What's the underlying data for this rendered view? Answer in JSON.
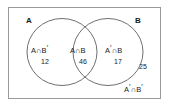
{
  "diagram": {
    "type": "venn-two-set",
    "universe_border_color": "#9a9a9a",
    "circle_stroke_color": "#6f6f6f",
    "text_color": "#1a1a1a",
    "sets": {
      "left": {
        "letter": "A"
      },
      "right": {
        "letter": "B"
      }
    },
    "regions": [
      {
        "id": "a-only",
        "name_base": "A",
        "name_operator": "∩",
        "name_second": "B",
        "name_second_prime": "′",
        "name_full": "A∩B′",
        "count": "12"
      },
      {
        "id": "both",
        "name_base": "A",
        "name_operator": "∩",
        "name_second": "B",
        "name_second_prime": "",
        "name_full": "A∩B",
        "count": "46"
      },
      {
        "id": "b-only",
        "name_base": "A",
        "name_base_prime": "′",
        "name_operator": "∩",
        "name_second": "B",
        "name_full": "A′∩B",
        "count": "17"
      },
      {
        "id": "neither",
        "name_base": "A",
        "name_base_prime": "′",
        "name_operator": "∩",
        "name_second": "B",
        "name_second_prime": "′",
        "name_full": "A′∩B′",
        "count": "25"
      }
    ]
  }
}
